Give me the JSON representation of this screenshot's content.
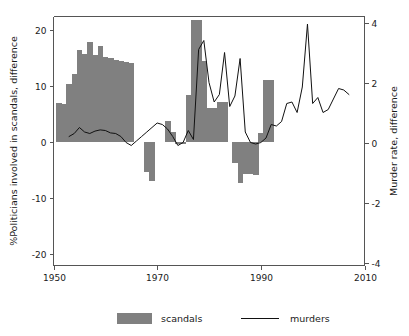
{
  "chart_data": {
    "type": "bar",
    "title": "",
    "subtitle": "",
    "xlabel": "",
    "ylabel": "%Politicians involved in scandals, difference",
    "y2label": "Murder rate, difference",
    "xlim": [
      1950,
      2010
    ],
    "ylim": [
      -22,
      22.5
    ],
    "y2lim": [
      -4.1,
      4.2
    ],
    "xticks": [
      1950,
      1970,
      1990,
      2010
    ],
    "xtick_labels": [
      "1950",
      "1970",
      "1990",
      "2010"
    ],
    "yticks": [
      -20,
      -10,
      0,
      10,
      20
    ],
    "ytick_labels": [
      "-20",
      "-10",
      "0",
      "10",
      "20"
    ],
    "y2ticks": [
      -4,
      -2,
      0,
      2,
      4
    ],
    "y2tick_labels": [
      "-4",
      "-2",
      "0",
      "2",
      "4"
    ],
    "grid": false,
    "legend_position": "bottom",
    "bar_color": "#808080",
    "line_color": "#111111",
    "axis_color": "#555555",
    "background": "#ffffff",
    "series": [
      {
        "name": "scandals",
        "type": "bar",
        "axis": "left",
        "color": "#808080",
        "x": [
          1951,
          1952,
          1953,
          1954,
          1955,
          1956,
          1957,
          1958,
          1959,
          1960,
          1961,
          1962,
          1963,
          1964,
          1965,
          1966,
          1967,
          1968,
          1969,
          1970,
          1971,
          1972,
          1973,
          1974,
          1975,
          1976,
          1977,
          1978,
          1979,
          1980,
          1981,
          1982,
          1983,
          1984,
          1985,
          1986,
          1987,
          1988,
          1989,
          1990,
          1991,
          1992,
          1993
        ],
        "values": [
          7.0,
          6.8,
          10.5,
          12.2,
          16.5,
          15.8,
          18.0,
          15.6,
          17.2,
          15.2,
          15.0,
          14.8,
          14.5,
          14.3,
          14.2,
          0,
          0,
          -5.2,
          -6.9,
          0,
          0,
          3.9,
          1.9,
          -0.3,
          -0.3,
          8.5,
          21.8,
          21.8,
          14.6,
          6.2,
          6.2,
          7.3,
          7.3,
          0,
          -3.7,
          -7.2,
          -5.6,
          -5.7,
          -5.8,
          1.6,
          11.2,
          11.2,
          0
        ]
      },
      {
        "name": "murders",
        "type": "line",
        "axis": "right",
        "color": "#111111",
        "x": [
          1953,
          1954,
          1955,
          1956,
          1957,
          1958,
          1959,
          1960,
          1961,
          1962,
          1963,
          1964,
          1965,
          1966,
          1967,
          1968,
          1969,
          1970,
          1971,
          1972,
          1973,
          1974,
          1975,
          1976,
          1977,
          1978,
          1979,
          1980,
          1981,
          1982,
          1983,
          1984,
          1985,
          1986,
          1987,
          1988,
          1989,
          1990,
          1991,
          1992,
          1993,
          1994,
          1995,
          1996,
          1997,
          1998,
          1999,
          2000,
          2001,
          2002,
          2003,
          2004,
          2005,
          2006,
          2007
        ],
        "values": [
          0.2,
          0.3,
          0.5,
          0.35,
          0.3,
          0.38,
          0.42,
          0.4,
          0.32,
          0.3,
          0.2,
          0.0,
          -0.1,
          0.05,
          0.2,
          0.35,
          0.5,
          0.65,
          0.6,
          0.45,
          0.2,
          -0.1,
          0.0,
          0.4,
          0.1,
          3.1,
          3.4,
          2.0,
          1.35,
          1.6,
          3.0,
          1.2,
          1.55,
          2.8,
          0.35,
          0.0,
          -0.05,
          0.0,
          0.15,
          0.6,
          0.55,
          0.7,
          1.3,
          1.35,
          1.0,
          1.85,
          3.95,
          1.3,
          1.5,
          1.0,
          1.1,
          1.45,
          1.8,
          1.75,
          1.6
        ]
      }
    ],
    "legend": [
      {
        "label": "scandals",
        "marker": "bar-swatch",
        "color": "#808080"
      },
      {
        "label": "murders",
        "marker": "line-swatch",
        "color": "#111111"
      }
    ]
  }
}
